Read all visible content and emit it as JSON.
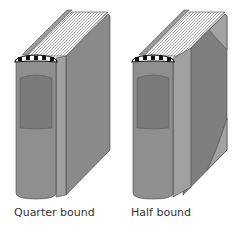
{
  "figures": [
    {
      "id": "quarter",
      "caption": "Quarter bound"
    },
    {
      "id": "half",
      "caption": "Half bound"
    }
  ],
  "colors": {
    "spine": "#8f8f8f",
    "spine_label": "#7a7a7a",
    "board": "#a3a3a3",
    "cover": "#8a8a8a",
    "cover_dark": "#777777",
    "corner": "#9a9a9a",
    "pages": "#ffffff",
    "page_lines": "#666666",
    "headband_dark": "#111111",
    "outline": "#444444"
  }
}
